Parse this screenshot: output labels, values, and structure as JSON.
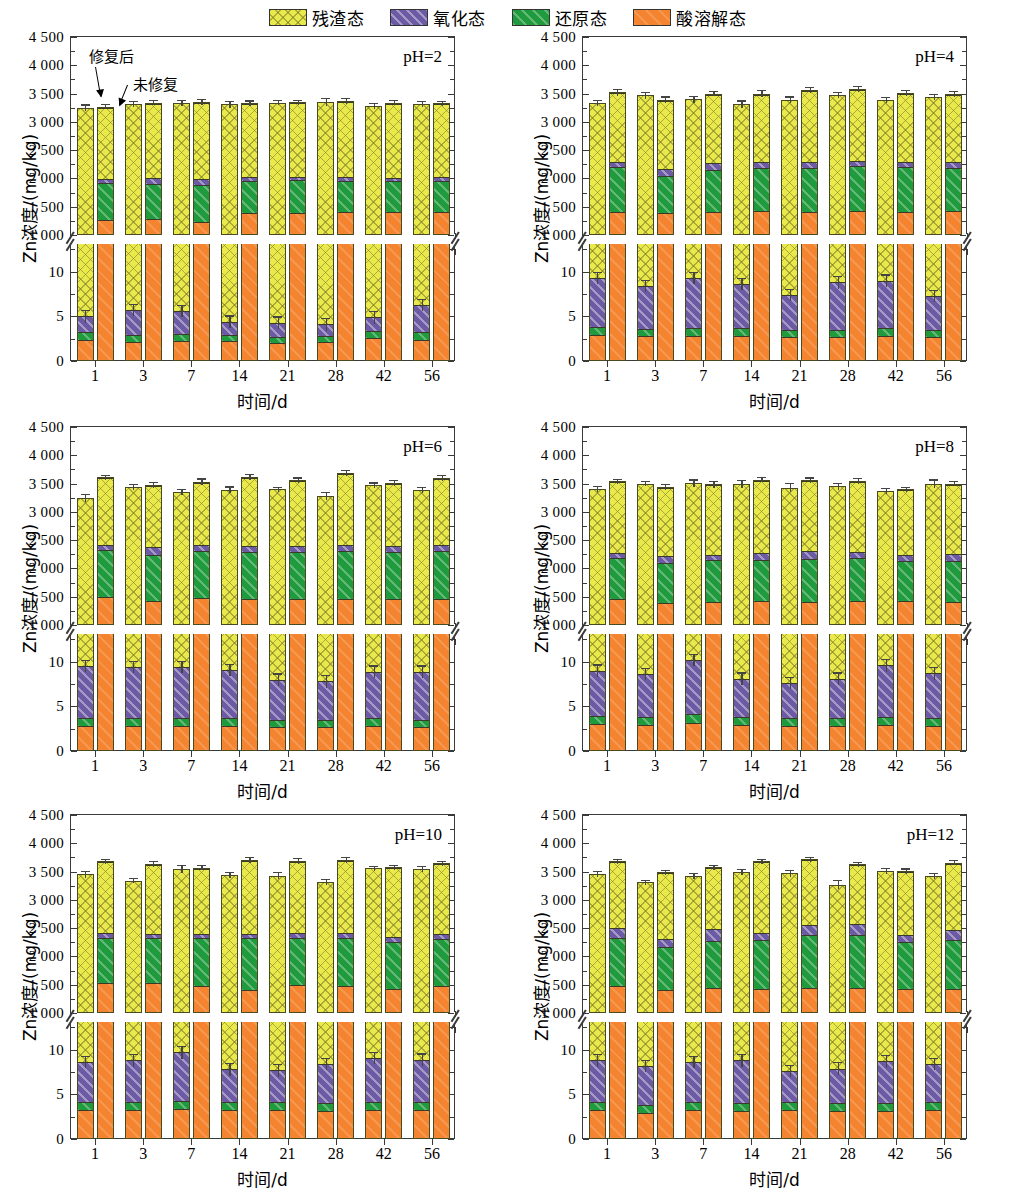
{
  "legend": {
    "items": [
      {
        "label": "残渣态",
        "key": "residual",
        "color": "#e9e94b",
        "pattern": "crosshatch"
      },
      {
        "label": "氧化态",
        "key": "oxidizable",
        "color": "#6c5ba4",
        "pattern": "diagonal"
      },
      {
        "label": "还原态",
        "key": "reducible",
        "color": "#1f9a3c",
        "pattern": "diagonal"
      },
      {
        "label": "酸溶解态",
        "key": "acid_soluble",
        "color": "#f4842f",
        "pattern": "solid"
      }
    ]
  },
  "axes": {
    "ylabel": "Zn浓度/(mg/kg)",
    "xlabel": "时间/d",
    "upper_ticks": [
      "1 000",
      "1 500",
      "2 000",
      "2 500",
      "3 000",
      "3 500",
      "4 000",
      "4 500"
    ],
    "lower_ticks": [
      "0",
      "5",
      "10"
    ],
    "upper_range": [
      1000,
      4500
    ],
    "lower_range": [
      0,
      13
    ],
    "broken_axis": true
  },
  "annotations": {
    "remediated": "修复后",
    "unremediated": "未修复"
  },
  "chart_data": {
    "type": "bar",
    "subtype": "stacked-grouped-broken-axis",
    "title": "",
    "xlabel": "时间/d",
    "ylabel": "Zn浓度/(mg/kg)",
    "categories": [
      "1",
      "3",
      "7",
      "14",
      "21",
      "28",
      "42",
      "56"
    ],
    "series_names": [
      "酸溶解态",
      "还原态",
      "氧化态",
      "残渣态"
    ],
    "group_names": [
      "修复后",
      "未修复"
    ],
    "ylim_upper": [
      1000,
      4500
    ],
    "ylim_lower": [
      0,
      13
    ],
    "grid": false,
    "legend_position": "top",
    "panels": [
      {
        "label": "pH=2",
        "remediated": {
          "acid_soluble": [
            2.4,
            2.1,
            2.2,
            2.2,
            2.0,
            2.1,
            2.6,
            2.4
          ],
          "reducible": [
            0.8,
            0.8,
            0.8,
            0.7,
            0.7,
            0.7,
            0.8,
            0.8
          ],
          "oxidizable": [
            5.0,
            5.7,
            5.6,
            4.4,
            4.3,
            4.1,
            4.9,
            6.3
          ],
          "residual_top": [
            3250,
            3320,
            3340,
            3310,
            3340,
            3350,
            3280,
            3320
          ],
          "err": [
            60,
            55,
            55,
            60,
            50,
            75,
            60,
            55
          ]
        },
        "unremediated": {
          "acid_soluble": [
            1280,
            1300,
            1240,
            1400,
            1400,
            1420,
            1430,
            1430
          ],
          "reducible": [
            1940,
            1920,
            1900,
            1980,
            1990,
            1980,
            1970,
            1980
          ],
          "oxidizable": [
            2010,
            2030,
            2010,
            2040,
            2050,
            2040,
            2030,
            2040
          ],
          "residual_top": [
            3270,
            3340,
            3350,
            3330,
            3350,
            3370,
            3340,
            3330
          ],
          "err": [
            45,
            45,
            50,
            50,
            45,
            50,
            45,
            45
          ]
        }
      },
      {
        "label": "pH=4",
        "remediated": {
          "acid_soluble": [
            2.9,
            2.8,
            2.8,
            2.8,
            2.7,
            2.7,
            2.8,
            2.7
          ],
          "reducible": [
            0.9,
            0.8,
            0.9,
            0.9,
            0.8,
            0.8,
            0.9,
            0.8
          ],
          "oxidizable": [
            9.3,
            8.4,
            9.3,
            8.6,
            7.4,
            8.8,
            9.0,
            7.3
          ],
          "residual_top": [
            3340,
            3470,
            3400,
            3310,
            3390,
            3480,
            3390,
            3440
          ],
          "err": [
            55,
            60,
            60,
            70,
            60,
            55,
            55,
            55
          ]
        },
        "unremediated": {
          "acid_soluble": [
            1430,
            1410,
            1430,
            1440,
            1430,
            1450,
            1430,
            1450
          ],
          "reducible": [
            2220,
            2060,
            2170,
            2200,
            2210,
            2230,
            2220,
            2210
          ],
          "oxidizable": [
            2300,
            2190,
            2290,
            2300,
            2300,
            2320,
            2300,
            2300
          ],
          "residual_top": [
            3520,
            3390,
            3500,
            3500,
            3570,
            3580,
            3510,
            3490
          ],
          "err": [
            60,
            60,
            45,
            60,
            55,
            60,
            60,
            55
          ]
        }
      },
      {
        "label": "pH=6",
        "remediated": {
          "acid_soluble": [
            2.8,
            2.8,
            2.8,
            2.8,
            2.7,
            2.7,
            2.8,
            2.7
          ],
          "reducible": [
            0.9,
            0.9,
            0.9,
            0.9,
            0.8,
            0.8,
            0.9,
            0.8
          ],
          "oxidizable": [
            9.5,
            9.4,
            9.4,
            9.1,
            8.0,
            7.8,
            8.9,
            8.9
          ],
          "residual_top": [
            3250,
            3440,
            3350,
            3390,
            3400,
            3280,
            3470,
            3390
          ],
          "err": [
            70,
            55,
            60,
            60,
            45,
            75,
            50,
            55
          ]
        },
        "unremediated": {
          "acid_soluble": [
            1520,
            1450,
            1500,
            1470,
            1470,
            1480,
            1470,
            1480
          ],
          "reducible": [
            2340,
            2260,
            2330,
            2310,
            2300,
            2320,
            2310,
            2320
          ],
          "oxidizable": [
            2440,
            2400,
            2440,
            2420,
            2410,
            2430,
            2420,
            2430
          ],
          "residual_top": [
            3610,
            3470,
            3530,
            3620,
            3560,
            3690,
            3510,
            3600
          ],
          "err": [
            50,
            55,
            60,
            55,
            50,
            50,
            55,
            50
          ]
        }
      },
      {
        "label": "pH=8",
        "remediated": {
          "acid_soluble": [
            3.0,
            2.9,
            3.1,
            2.9,
            2.8,
            2.8,
            2.9,
            2.8
          ],
          "reducible": [
            0.9,
            0.9,
            1.0,
            0.9,
            0.9,
            0.9,
            0.9,
            0.9
          ],
          "oxidizable": [
            9.0,
            8.6,
            10.2,
            8.1,
            7.6,
            8.1,
            9.6,
            8.7
          ],
          "residual_top": [
            3400,
            3500,
            3510,
            3500,
            3430,
            3450,
            3370,
            3500
          ],
          "err": [
            55,
            45,
            65,
            70,
            80,
            55,
            50,
            75
          ]
        },
        "unremediated": {
          "acid_soluble": [
            1470,
            1400,
            1430,
            1440,
            1430,
            1440,
            1440,
            1420
          ],
          "reducible": [
            2200,
            2110,
            2160,
            2170,
            2190,
            2200,
            2140,
            2150
          ],
          "oxidizable": [
            2290,
            2230,
            2260,
            2290,
            2320,
            2300,
            2250,
            2270
          ],
          "residual_top": [
            3540,
            3440,
            3490,
            3570,
            3560,
            3550,
            3400,
            3500
          ],
          "err": [
            45,
            50,
            60,
            50,
            50,
            55,
            45,
            40
          ]
        }
      },
      {
        "label": "pH=10",
        "remediated": {
          "acid_soluble": [
            3.3,
            3.2,
            3.4,
            3.2,
            3.2,
            3.1,
            3.3,
            3.2
          ],
          "reducible": [
            0.9,
            0.9,
            0.9,
            0.9,
            0.9,
            0.9,
            0.9,
            0.9
          ],
          "oxidizable": [
            8.6,
            8.8,
            9.7,
            7.8,
            7.7,
            8.4,
            9.1,
            8.9
          ],
          "residual_top": [
            3450,
            3340,
            3550,
            3440,
            3430,
            3310,
            3560,
            3540
          ],
          "err": [
            55,
            50,
            70,
            60,
            60,
            55,
            45,
            55
          ]
        },
        "unremediated": {
          "acid_soluble": [
            1550,
            1540,
            1500,
            1430,
            1520,
            1500,
            1440,
            1490
          ],
          "reducible": [
            2350,
            2340,
            2350,
            2340,
            2350,
            2350,
            2280,
            2330
          ],
          "oxidizable": [
            2430,
            2410,
            2420,
            2420,
            2430,
            2430,
            2360,
            2420
          ],
          "residual_top": [
            3680,
            3630,
            3570,
            3710,
            3690,
            3710,
            3580,
            3650
          ],
          "err": [
            50,
            55,
            50,
            55,
            50,
            50,
            45,
            45
          ]
        }
      },
      {
        "label": "pH=12",
        "remediated": {
          "acid_soluble": [
            3.3,
            2.9,
            3.2,
            3.1,
            3.2,
            3.1,
            3.1,
            3.2
          ],
          "reducible": [
            0.9,
            0.9,
            0.9,
            0.9,
            0.9,
            0.9,
            0.9,
            0.9
          ],
          "oxidizable": [
            8.8,
            8.2,
            8.6,
            8.8,
            7.6,
            7.9,
            8.7,
            8.4
          ],
          "residual_top": [
            3460,
            3310,
            3420,
            3490,
            3470,
            3270,
            3510,
            3420
          ],
          "err": [
            55,
            45,
            50,
            55,
            60,
            80,
            50,
            50
          ]
        },
        "unremediated": {
          "acid_soluble": [
            1500,
            1420,
            1460,
            1450,
            1460,
            1460,
            1450,
            1450
          ],
          "reducible": [
            2340,
            2180,
            2290,
            2310,
            2400,
            2400,
            2270,
            2310
          ],
          "oxidizable": [
            2520,
            2330,
            2500,
            2430,
            2580,
            2590,
            2400,
            2490
          ],
          "residual_top": [
            3680,
            3490,
            3580,
            3680,
            3720,
            3630,
            3510,
            3660
          ],
          "err": [
            45,
            45,
            45,
            50,
            45,
            45,
            45,
            45
          ]
        }
      }
    ]
  }
}
